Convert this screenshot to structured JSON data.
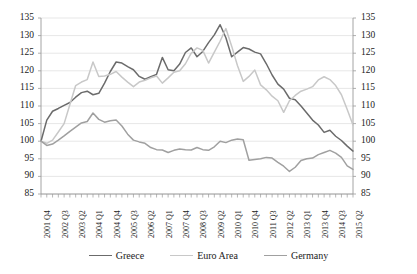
{
  "chart_data": {
    "type": "line",
    "title": "",
    "subtitle": "",
    "xlabel": "",
    "ylabel": "",
    "ylim": [
      85,
      135
    ],
    "ytick_step": 5,
    "yticks": [
      85,
      90,
      95,
      100,
      105,
      110,
      115,
      120,
      125,
      130,
      135
    ],
    "grid": true,
    "dual_y_axis": true,
    "legend_position": "bottom",
    "x": [
      "2001 Q4",
      "2002 Q1",
      "2002 Q2",
      "2002 Q3",
      "2002 Q4",
      "2003 Q1",
      "2003 Q2",
      "2003 Q3",
      "2003 Q4",
      "2004 Q1",
      "2004 Q2",
      "2004 Q3",
      "2004 Q4",
      "2005 Q1",
      "2005 Q2",
      "2005 Q3",
      "2005 Q4",
      "2006 Q1",
      "2006 Q2",
      "2006 Q3",
      "2006 Q4",
      "2007 Q1",
      "2007 Q2",
      "2007 Q3",
      "2007 Q4",
      "2008 Q1",
      "2008 Q2",
      "2008 Q3",
      "2008 Q4",
      "2009 Q1",
      "2009 Q2",
      "2009 Q3",
      "2009 Q4",
      "2010 Q1",
      "2010 Q2",
      "2010 Q3",
      "2010 Q4",
      "2011 Q1",
      "2011 Q2",
      "2011 Q3",
      "2011 Q4",
      "2012 Q1",
      "2012 Q2",
      "2012 Q3",
      "2012 Q4",
      "2013 Q1",
      "2013 Q2",
      "2013 Q3",
      "2013 Q4",
      "2014 Q1",
      "2014 Q2",
      "2014 Q3",
      "2014 Q4",
      "2015 Q1",
      "2015 Q2"
    ],
    "xtick_labels_shown": [
      "2001 Q4",
      "2002 Q3",
      "2003 Q2",
      "2004 Q1",
      "2004 Q4",
      "2005 Q3",
      "2006 Q2",
      "2007 Q1",
      "2007 Q4",
      "2008 Q3",
      "2009 Q2",
      "2010 Q1",
      "2010 Q4",
      "2011 Q3",
      "2012 Q2",
      "2013 Q1",
      "2013 Q4",
      "2014 Q3",
      "2015 Q2"
    ],
    "xtick_label_every": 3,
    "series": [
      {
        "name": "Greece",
        "color": "#6b6b6b",
        "values": [
          100.0,
          106.0,
          108.5,
          109.3,
          110.2,
          111.0,
          112.5,
          113.8,
          114.2,
          113.2,
          113.6,
          116.5,
          119.8,
          122.5,
          122.2,
          121.2,
          120.3,
          118.4,
          117.6,
          118.3,
          119.0,
          123.8,
          120.3,
          120.0,
          121.9,
          125.2,
          126.5,
          124.0,
          125.5,
          128.0,
          130.2,
          133.1,
          129.4,
          124.0,
          125.3,
          126.6,
          126.2,
          125.3,
          124.8,
          122.0,
          118.8,
          116.2,
          114.8,
          112.2,
          111.8,
          110.0,
          108.0,
          106.0,
          104.6,
          102.5,
          103.1,
          101.4,
          100.2,
          98.6,
          97.2
        ]
      },
      {
        "name": "Euro Area",
        "color": "#c8c8c8",
        "values": [
          100.0,
          99.4,
          100.3,
          102.6,
          105.0,
          110.4,
          115.8,
          116.8,
          117.5,
          122.5,
          118.4,
          118.5,
          119.0,
          119.8,
          118.2,
          116.8,
          115.5,
          116.8,
          117.3,
          118.0,
          118.5,
          116.5,
          118.0,
          119.6,
          120.0,
          122.0,
          125.0,
          126.5,
          125.8,
          122.2,
          125.3,
          128.4,
          132.0,
          127.0,
          121.5,
          117.0,
          118.4,
          120.2,
          116.0,
          114.6,
          112.8,
          111.5,
          108.2,
          111.5,
          113.0,
          114.2,
          114.8,
          115.5,
          117.4,
          118.3,
          117.5,
          115.8,
          113.2,
          109.0,
          104.6
        ]
      },
      {
        "name": "Germany",
        "color": "#a0a0a0",
        "values": [
          100.0,
          98.8,
          99.2,
          100.3,
          101.5,
          102.8,
          104.0,
          105.2,
          105.6,
          108.0,
          106.2,
          105.4,
          105.8,
          106.0,
          104.3,
          102.0,
          100.3,
          99.8,
          99.4,
          98.2,
          97.6,
          97.5,
          96.8,
          97.4,
          97.8,
          97.6,
          97.5,
          98.2,
          97.6,
          97.4,
          98.4,
          100.0,
          99.6,
          100.3,
          100.6,
          100.4,
          94.6,
          94.8,
          95.0,
          95.4,
          95.2,
          94.0,
          92.9,
          91.4,
          92.6,
          94.5,
          95.0,
          95.2,
          96.2,
          96.8,
          97.4,
          96.6,
          95.4,
          93.0,
          92.0
        ]
      }
    ],
    "legend": [
      {
        "label": "Greece",
        "color": "#6b6b6b"
      },
      {
        "label": "Euro Area",
        "color": "#c8c8c8"
      },
      {
        "label": "Germany",
        "color": "#a0a0a0"
      }
    ],
    "axis": {
      "line_color": "#9a9a9a",
      "grid_color": "#dcdcdc"
    }
  }
}
